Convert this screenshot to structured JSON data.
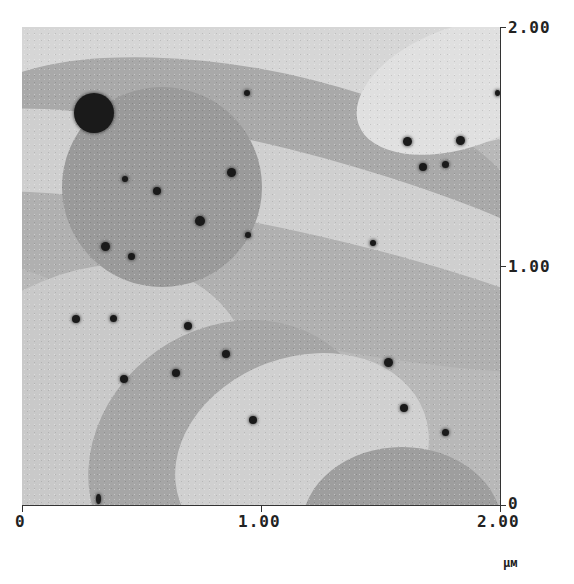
{
  "image": {
    "type": "AFM topography micrograph",
    "colormap": "grayscale",
    "scan_size": "2.00 x 2.00 μm"
  },
  "x_axis": {
    "ticks": [
      "0",
      "1.00",
      "2.00"
    ],
    "unit": "μм"
  },
  "y_axis": {
    "ticks": [
      "0",
      "1.00",
      "2.00"
    ]
  },
  "colors": {
    "background": "#ffffff",
    "axis": "#333333",
    "text": "#222222"
  }
}
